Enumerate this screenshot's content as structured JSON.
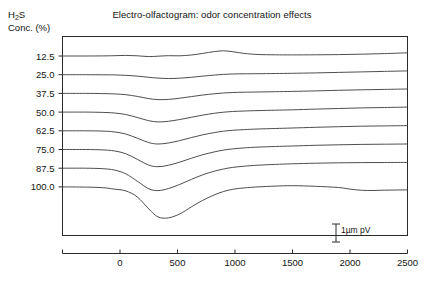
{
  "chart_data": {
    "type": "line",
    "title": "Electro-olfactogram: odor concentration effects",
    "ylabel_line1": "H2S",
    "ylabel_line2": "Conc. (%)",
    "xlabel": "",
    "grid": false,
    "legend": "none",
    "xlim": [
      -500,
      2500
    ],
    "xticks": [
      0,
      500,
      1000,
      1500,
      2000,
      2500
    ],
    "xtick_labels": [
      "0",
      "500",
      "1000",
      "1500",
      "2000",
      "2500"
    ],
    "ytick_labels": [
      "12.5",
      "25.0",
      "37.5",
      "50.0",
      "62.5",
      "75.0",
      "87.5",
      "100.0"
    ],
    "ytick_values": [
      12.5,
      25.0,
      37.5,
      50.0,
      62.5,
      75.0,
      87.5,
      100.0
    ],
    "ylabel_note": "Traces are vertically offset; each baseline marks its concentration level",
    "annotation": {
      "scalebar_label": "1µm pV",
      "scalebar_x": 2050,
      "type": "vertical-scale-bar"
    },
    "series": [
      {
        "name": "12.5",
        "baseline": 12.5,
        "x": [
          -500,
          -300,
          -150,
          -50,
          50,
          150,
          250,
          330,
          420,
          520,
          620,
          720,
          820,
          900,
          980,
          1080,
          1200,
          1350,
          1500,
          1700,
          1900,
          2100,
          2300,
          2500
        ],
        "y": [
          0,
          0,
          0.1,
          0.3,
          0.6,
          0.2,
          -0.6,
          -0.2,
          0.3,
          0.2,
          1.0,
          2.6,
          4.4,
          5.2,
          4.3,
          2.6,
          1.5,
          1.2,
          1.1,
          1.2,
          1.4,
          1.8,
          2.4,
          3.2
        ]
      },
      {
        "name": "25.0",
        "baseline": 25.0,
        "x": [
          -500,
          -300,
          -150,
          -50,
          50,
          150,
          250,
          330,
          420,
          520,
          620,
          720,
          820,
          900,
          980,
          1080,
          1200,
          1350,
          1500,
          1700,
          1900,
          2100,
          2300,
          2500
        ],
        "y": [
          0,
          0,
          -0.1,
          -0.2,
          -0.6,
          -1.4,
          -2.6,
          -3.4,
          -3.8,
          -3.5,
          -2.6,
          -1.4,
          -0.4,
          0.3,
          0.7,
          0.9,
          1.0,
          1.2,
          1.4,
          1.8,
          2.3,
          2.8,
          3.3,
          3.8
        ]
      },
      {
        "name": "37.5",
        "baseline": 37.5,
        "x": [
          -500,
          -300,
          -150,
          -50,
          50,
          150,
          250,
          330,
          420,
          520,
          620,
          720,
          820,
          900,
          980,
          1080,
          1200,
          1350,
          1500,
          1700,
          1900,
          2100,
          2300,
          2500
        ],
        "y": [
          0,
          0,
          -0.2,
          -0.5,
          -1.3,
          -3.0,
          -5.2,
          -6.2,
          -6.0,
          -4.8,
          -3.2,
          -1.6,
          -0.4,
          0.4,
          0.9,
          1.2,
          1.4,
          1.7,
          2.0,
          2.5,
          3.1,
          3.6,
          4.0,
          4.4
        ]
      },
      {
        "name": "50.0",
        "baseline": 50.0,
        "x": [
          -500,
          -300,
          -150,
          -50,
          50,
          150,
          250,
          330,
          420,
          520,
          620,
          720,
          820,
          900,
          980,
          1080,
          1200,
          1350,
          1500,
          1700,
          1900,
          2100,
          2300,
          2500
        ],
        "y": [
          0,
          0,
          -0.3,
          -0.9,
          -2.4,
          -5.4,
          -8.6,
          -9.8,
          -9.2,
          -7.4,
          -5.2,
          -3.0,
          -1.2,
          -0.1,
          0.6,
          1.1,
          1.5,
          1.9,
          2.3,
          3.0,
          3.6,
          4.2,
          4.6,
          5.0
        ]
      },
      {
        "name": "62.5",
        "baseline": 62.5,
        "x": [
          -500,
          -300,
          -150,
          -50,
          50,
          150,
          250,
          330,
          420,
          520,
          620,
          720,
          820,
          900,
          980,
          1080,
          1200,
          1350,
          1500,
          1700,
          1900,
          2100,
          2300,
          2500
        ],
        "y": [
          0,
          0,
          -0.3,
          -1.1,
          -3.2,
          -7.4,
          -11.8,
          -13.2,
          -12.2,
          -9.8,
          -6.8,
          -4.0,
          -1.8,
          -0.4,
          0.5,
          1.2,
          1.8,
          2.3,
          2.8,
          3.5,
          4.1,
          4.6,
          4.9,
          5.2
        ]
      },
      {
        "name": "75.0",
        "baseline": 75.0,
        "x": [
          -500,
          -300,
          -150,
          -50,
          50,
          150,
          250,
          330,
          420,
          520,
          620,
          720,
          820,
          900,
          980,
          1080,
          1200,
          1350,
          1500,
          1700,
          1900,
          2100,
          2300,
          2500
        ],
        "y": [
          0,
          0,
          -0.4,
          -1.4,
          -4.2,
          -9.8,
          -15.6,
          -17.2,
          -15.8,
          -12.6,
          -8.8,
          -5.2,
          -2.4,
          -0.6,
          0.6,
          1.6,
          2.4,
          3.0,
          3.5,
          4.2,
          4.7,
          5.1,
          5.3,
          5.5
        ]
      },
      {
        "name": "87.5",
        "baseline": 87.5,
        "x": [
          -500,
          -300,
          -150,
          -50,
          50,
          150,
          250,
          330,
          420,
          520,
          620,
          720,
          820,
          900,
          980,
          1080,
          1200,
          1350,
          1500,
          1700,
          1900,
          2100,
          2300,
          2500
        ],
        "y": [
          0,
          0,
          -0.5,
          -1.8,
          -5.6,
          -13.0,
          -20.6,
          -22.4,
          -20.4,
          -16.2,
          -11.2,
          -6.6,
          -3.0,
          -0.8,
          0.8,
          2.0,
          3.0,
          3.8,
          4.4,
          5.0,
          5.4,
          5.6,
          5.7,
          5.8
        ]
      },
      {
        "name": "100.0",
        "baseline": 100.0,
        "x": [
          -500,
          -300,
          -150,
          -50,
          50,
          150,
          250,
          330,
          420,
          520,
          620,
          720,
          820,
          900,
          980,
          1080,
          1200,
          1350,
          1500,
          1700,
          1900,
          2000,
          2100,
          2200,
          2300,
          2400,
          2500
        ],
        "y": [
          0,
          -0.2,
          -0.8,
          -2.2,
          -4.0,
          -10.0,
          -22.0,
          -30.0,
          -31.0,
          -27.0,
          -20.0,
          -13.4,
          -8.0,
          -4.6,
          -2.4,
          -1.0,
          0.0,
          0.8,
          1.2,
          0.6,
          -0.6,
          -2.2,
          -3.4,
          -3.6,
          -3.3,
          -3.1,
          -3.0
        ]
      }
    ]
  }
}
